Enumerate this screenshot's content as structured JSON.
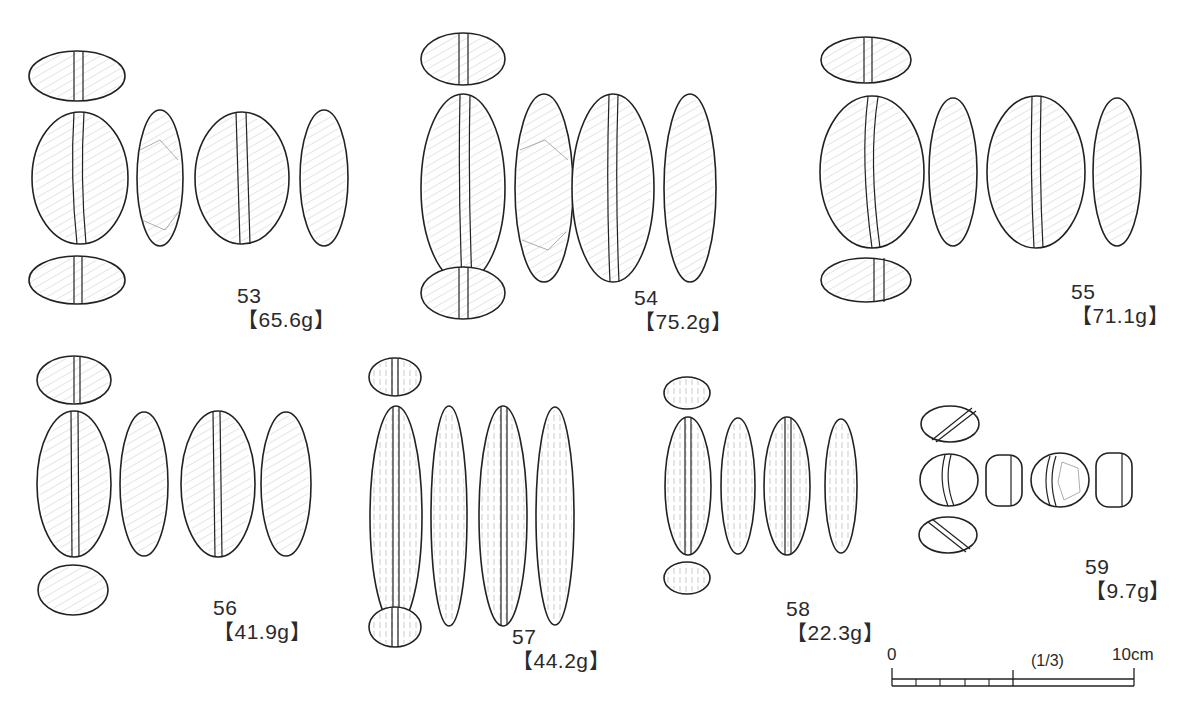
{
  "figure": {
    "items": [
      {
        "number": "53",
        "weight": "【65.6g】"
      },
      {
        "number": "54",
        "weight": "【75.2g】"
      },
      {
        "number": "55",
        "weight": "【71.1g】"
      },
      {
        "number": "56",
        "weight": "【41.9g】"
      },
      {
        "number": "57",
        "weight": "【44.2g】"
      },
      {
        "number": "58",
        "weight": "【22.3g】"
      },
      {
        "number": "59",
        "weight": "【9.7g】"
      }
    ],
    "scale_bar": {
      "start_label": "0",
      "ratio_label": "(1/3)",
      "end_label": "10cm",
      "minor_divisions": 5
    }
  }
}
